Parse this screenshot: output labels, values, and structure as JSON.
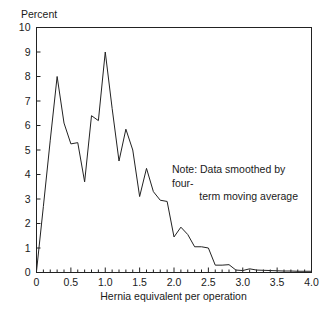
{
  "chart_data": {
    "type": "line",
    "title": "",
    "xlabel": "Hernia equivalent per operation",
    "ylabel": "Percent",
    "xlim": [
      0,
      4.0
    ],
    "ylim": [
      0,
      10
    ],
    "grid": false,
    "legend": null,
    "annotations": [
      {
        "id": "note",
        "line1": "Note: Data smoothed by four-",
        "line2": "term moving average",
        "x": 2.0,
        "y": 3.9
      }
    ],
    "xticks": [
      0,
      0.5,
      1.0,
      1.5,
      2.0,
      2.5,
      3.0,
      3.5,
      4.0
    ],
    "xtick_labels": [
      "0",
      "0.5",
      "1.0",
      "1.5",
      "2.0",
      "2.5",
      "3.0",
      "3.5",
      "4.0"
    ],
    "xminor_step": 0.1,
    "yticks": [
      0,
      1,
      2,
      3,
      4,
      5,
      6,
      7,
      8,
      9,
      10
    ],
    "ytick_labels": [
      "0",
      "1",
      "2",
      "3",
      "4",
      "5",
      "6",
      "7",
      "8",
      "9",
      "10"
    ],
    "line_color": "#222222",
    "line_width": 1.0,
    "x": [
      0.0,
      0.1,
      0.2,
      0.3,
      0.4,
      0.5,
      0.6,
      0.7,
      0.8,
      0.9,
      1.0,
      1.1,
      1.2,
      1.3,
      1.4,
      1.5,
      1.6,
      1.7,
      1.8,
      1.9,
      2.0,
      2.1,
      2.2,
      2.3,
      2.4,
      2.5,
      2.6,
      2.7,
      2.8,
      2.9,
      3.0,
      3.1,
      3.2,
      3.3,
      3.4,
      3.5,
      3.6,
      3.7,
      3.8,
      3.9,
      4.0
    ],
    "values": [
      0.05,
      2.7,
      5.4,
      8.0,
      6.1,
      5.25,
      5.3,
      3.7,
      6.4,
      6.2,
      9.0,
      6.7,
      4.55,
      5.85,
      5.0,
      3.1,
      4.25,
      3.3,
      2.95,
      2.9,
      1.45,
      1.85,
      1.55,
      1.05,
      1.05,
      1.0,
      0.3,
      0.3,
      0.32,
      0.1,
      0.08,
      0.15,
      0.1,
      0.09,
      0.08,
      0.07,
      0.06,
      0.06,
      0.05,
      0.05,
      0.05
    ],
    "series": [
      {
        "name": "Hernia equivalent distribution",
        "values": [
          0.05,
          2.7,
          5.4,
          8.0,
          6.1,
          5.25,
          5.3,
          3.7,
          6.4,
          6.2,
          9.0,
          6.7,
          4.55,
          5.85,
          5.0,
          3.1,
          4.25,
          3.3,
          2.95,
          2.9,
          1.45,
          1.85,
          1.55,
          1.05,
          1.05,
          1.0,
          0.3,
          0.3,
          0.32,
          0.1,
          0.08,
          0.15,
          0.1,
          0.09,
          0.08,
          0.07,
          0.06,
          0.06,
          0.05,
          0.05,
          0.05
        ]
      }
    ]
  }
}
